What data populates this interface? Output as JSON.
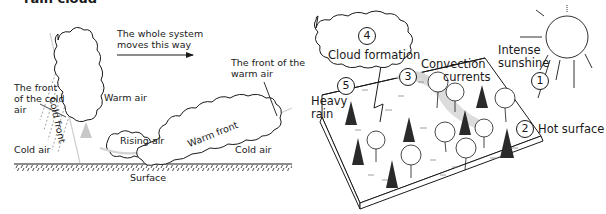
{
  "clipped_heading": "rain cloud",
  "left_diagram": {
    "system_motion": "The whole system moves this way",
    "system_motion_line1": "The whole system",
    "system_motion_line2": "moves this way",
    "front_of_warm_air_line1": "The front of the",
    "front_of_warm_air_line2": "warm air",
    "front_of_cold_air_line1": "The front",
    "front_of_cold_air_line2": "of the cold",
    "front_of_cold_air_line3": "air",
    "cold_front": "Cold front",
    "warm_air": "Warm air",
    "rising_air": "Rising air",
    "warm_front": "Warm front",
    "cold_air_left": "Cold air",
    "cold_air_right": "Cold air",
    "surface": "Surface"
  },
  "right_diagram": {
    "steps": [
      {
        "number": "1",
        "label": "Intense sunshine",
        "line1": "Intense",
        "line2": "sunshine"
      },
      {
        "number": "2",
        "label": "Hot surface"
      },
      {
        "number": "3",
        "label": "Convection currents",
        "line1": "Convection",
        "line2": "currents"
      },
      {
        "number": "4",
        "label": "Cloud formation"
      },
      {
        "number": "5",
        "label": "Heavy rain",
        "line1": "Heavy",
        "line2": "rain"
      }
    ]
  },
  "colors": {
    "ink": "#1a1a1a",
    "shade": "#d6d6d6",
    "background": "#ffffff"
  }
}
